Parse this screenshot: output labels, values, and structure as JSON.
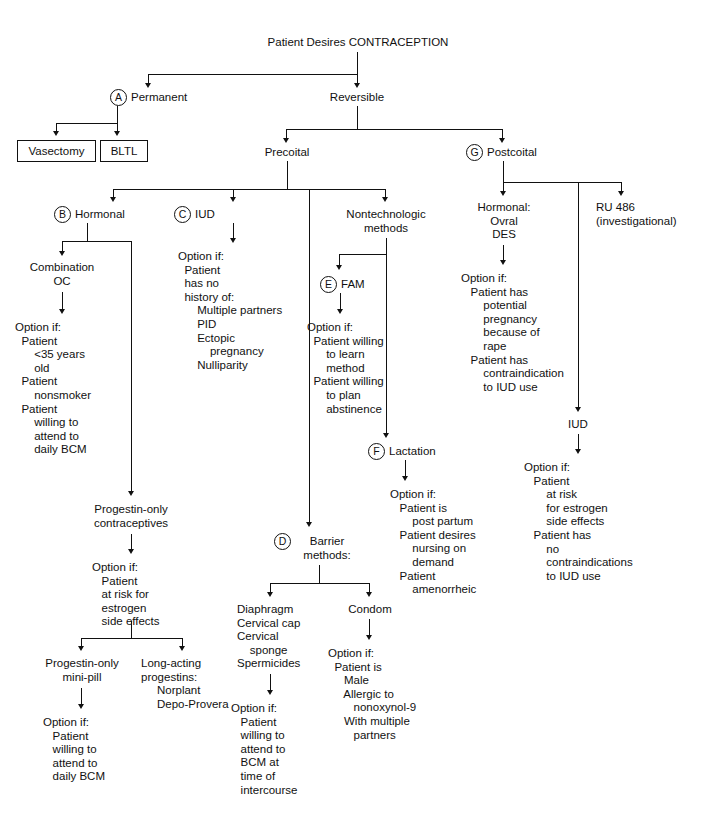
{
  "title": "Patient Desires CONTRACEPTION",
  "markers": {
    "a": "A",
    "b": "B",
    "c": "C",
    "d": "D",
    "e": "E",
    "f": "F",
    "g": "G"
  },
  "nodes": {
    "root": "Patient Desires CONTRACEPTION",
    "permanent": "Permanent",
    "reversible": "Reversible",
    "vasectomy": "Vasectomy",
    "bltl": "BLTL",
    "precoital": "Precoital",
    "postcoital": "Postcoital",
    "hormonal": "Hormonal",
    "iud": "IUD",
    "nontechnologic": "Nontechnologic\nmethods",
    "post_hormonal": "Hormonal:\nOvral\nDES",
    "ru486": "RU 486\n(investigational)",
    "combination_oc": "Combination\nOC",
    "iud_option": "Option if:\n  Patient\n  has no\n  history of:\n      Multiple partners\n      PID\n      Ectopic\n          pregnancy\n      Nulliparity",
    "fam": "FAM",
    "fam_option": "Option if:\n  Patient willing\n      to learn\n      method\n  Patient willing\n      to plan\n      abstinence",
    "post_hormonal_option": "Option if:\n   Patient has\n       potential\n       pregnancy\n       because of\n       rape\n   Patient has\n       contraindication\n       to IUD use",
    "combo_option": "Option if:\n  Patient\n      <35 years\n      old\n  Patient\n      nonsmoker\n  Patient\n      willing to\n      attend to\n      daily BCM",
    "lactation": "Lactation",
    "lactation_option": "Option if:\n   Patient is\n       post partum\n   Patient desires\n       nursing on\n       demand\n   Patient\n       amenorrheic",
    "post_iud": "IUD",
    "post_iud_option": "Option if:\n   Patient\n       at risk\n       for estrogen\n       side effects\n   Patient has\n       no\n       contraindications\n       to IUD use",
    "progestin_only": "Progestin-only\ncontraceptives",
    "progestin_option": "Option if:\n   Patient\n   at risk for\n   estrogen\n   side effects",
    "barrier": "Barrier\nmethods:",
    "barrier_list": "Diaphragm\nCervical cap\nCervical\n    sponge\nSpermicides",
    "condom": "Condom",
    "condom_option": "Option if:\n  Patient is\n     Male\n     Allergic to\n        nonoxynol-9\n     With multiple\n        partners",
    "barrier_option": "Option if:\n   Patient\n   willing to\n   attend to\n   BCM at\n   time of\n   intercourse",
    "mini_pill": "Progestin-only\nmini-pill",
    "long_acting": "Long-acting\nprogestins:\n     Norplant\n     Depo-Provera",
    "mini_pill_option": "Option if:\n   Patient\n   willing to\n   attend to\n   daily BCM"
  },
  "colors": {
    "line": "#111111",
    "text": "#111111",
    "background": "#ffffff"
  }
}
